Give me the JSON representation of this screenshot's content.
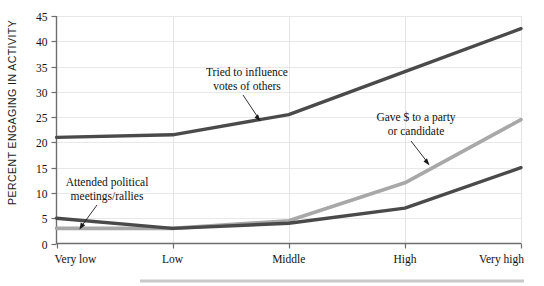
{
  "chart_data": {
    "type": "line",
    "title": "",
    "subtitle": "",
    "xlabel": "",
    "ylabel": "PERCENT ENGAGING IN ACTIVITY",
    "categories": [
      "Very low",
      "Low",
      "Middle",
      "High",
      "Very high"
    ],
    "ylim": [
      0,
      45
    ],
    "yticks": [
      0,
      5,
      10,
      15,
      20,
      25,
      30,
      35,
      40,
      45
    ],
    "ytick_labels": [
      "0",
      "5",
      "10",
      "15",
      "20",
      "25",
      "30",
      "35",
      "40",
      "45"
    ],
    "grid": "horizontal-and-vertical",
    "legend": "none-inline-annotations",
    "series": [
      {
        "name": "Tried to influence votes of others",
        "color": "#4a4a4a",
        "values": [
          21,
          21.5,
          25.5,
          34,
          42.5
        ]
      },
      {
        "name": "Gave $ to a party or candidate",
        "color": "#a8a8a8",
        "values": [
          3,
          3,
          4.5,
          12,
          24.5
        ]
      },
      {
        "name": "Attended political meetings/rallies",
        "color": "#4a4a4a",
        "values": [
          5,
          3,
          4,
          7,
          15
        ]
      }
    ],
    "annotations": [
      {
        "id": "influence",
        "line1": "Tried to influence",
        "line2": "votes of others",
        "points_to_series": "Tried to influence votes of others"
      },
      {
        "id": "gave-money",
        "line1": "Gave $ to a party",
        "line2": "or candidate",
        "points_to_series": "Gave $ to a party or candidate"
      },
      {
        "id": "meetings",
        "line1": "Attended political",
        "line2": "meetings/rallies",
        "points_to_series": "Attended political meetings/rallies"
      }
    ]
  },
  "axis": {
    "y_title": "PERCENT ENGAGING IN ACTIVITY",
    "y_ticks": [
      "45",
      "40",
      "35",
      "30",
      "25",
      "20",
      "15",
      "10",
      "5",
      "0"
    ],
    "x_categories": [
      "Very low",
      "Low",
      "Middle",
      "High",
      "Very high"
    ]
  },
  "colors": {
    "series_dark": "#4a4a4a",
    "series_gray": "#a8a8a8",
    "grid": "#e8e8e8",
    "axis": "#6e6e6e",
    "text": "#111111",
    "background": "#ffffff"
  }
}
